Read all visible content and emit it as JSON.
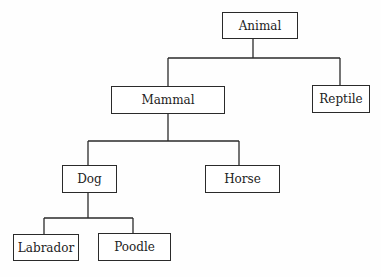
{
  "diagram": {
    "type": "tree",
    "nodes": {
      "animal": {
        "label": "Animal"
      },
      "mammal": {
        "label": "Mammal"
      },
      "reptile": {
        "label": "Reptile"
      },
      "dog": {
        "label": "Dog"
      },
      "horse": {
        "label": "Horse"
      },
      "labrador": {
        "label": "Labrador"
      },
      "poodle": {
        "label": "Poodle"
      }
    },
    "edges": [
      [
        "Animal",
        "Mammal"
      ],
      [
        "Animal",
        "Reptile"
      ],
      [
        "Mammal",
        "Dog"
      ],
      [
        "Mammal",
        "Horse"
      ],
      [
        "Dog",
        "Labrador"
      ],
      [
        "Dog",
        "Poodle"
      ]
    ],
    "line_color": "#2a2a2a"
  }
}
